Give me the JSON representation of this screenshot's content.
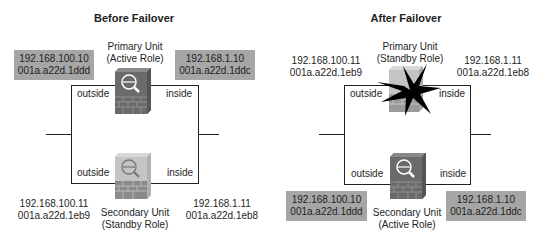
{
  "panels": [
    {
      "title": "Before Failover",
      "primary": {
        "name": "Primary Unit",
        "role": "(Active Role)",
        "state": "active",
        "outside_label": "outside",
        "inside_label": "inside",
        "outside_ip": "192.168.100.10",
        "outside_mac": "001a.a22d.1ddd",
        "inside_ip": "192.168.1.10",
        "inside_mac": "001a.a22d.1ddc"
      },
      "secondary": {
        "name": "Secondary Unit",
        "role": "(Standby Role)",
        "state": "standby",
        "outside_label": "outside",
        "inside_label": "inside",
        "outside_ip": "192.168.100.11",
        "outside_mac": "001a.a22d.1eb9",
        "inside_ip": "192.168.1.11",
        "inside_mac": "001a.a22d.1eb8"
      }
    },
    {
      "title": "After Failover",
      "primary": {
        "name": "Primary Unit",
        "role": "(Standby Role)",
        "state": "failed",
        "outside_label": "outside",
        "inside_label": "inside",
        "outside_ip": "192.168.100.11",
        "outside_mac": "001a.a22d.1eb9",
        "inside_ip": "192.168.1.11",
        "inside_mac": "001a.a22d.1eb8"
      },
      "secondary": {
        "name": "Secondary Unit",
        "role": "(Active Role)",
        "state": "active",
        "outside_label": "outside",
        "inside_label": "inside",
        "outside_ip": "192.168.100.10",
        "outside_mac": "001a.a22d.1ddd",
        "inside_ip": "192.168.1.10",
        "inside_mac": "001a.a22d.1ddc"
      }
    }
  ],
  "colors": {
    "active_address_box": "#a6a6a6",
    "firewall_active": "#6b6b6b",
    "firewall_standby": "#c4c4c4",
    "failure_burst": "#000000",
    "line": "#222222"
  }
}
